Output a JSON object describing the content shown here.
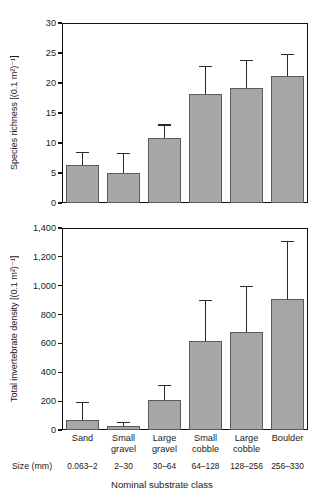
{
  "figure": {
    "background_color": "#ffffff",
    "bar_fill_color": "#a6a6a6",
    "bar_edge_color": "#5c5c5c",
    "axis_color": "#111111"
  },
  "axis": {
    "size_row_caption": "Size (mm)",
    "x_title": "Nominal substrate class"
  },
  "categories": [
    {
      "label_line1": "Sand",
      "label_line2": "",
      "size": "0.063–2"
    },
    {
      "label_line1": "Small",
      "label_line2": "gravel",
      "size": "2–30"
    },
    {
      "label_line1": "Large",
      "label_line2": "gravel",
      "size": "30–64"
    },
    {
      "label_line1": "Small",
      "label_line2": "cobble",
      "size": "64–128"
    },
    {
      "label_line1": "Large",
      "label_line2": "cobble",
      "size": "128–256"
    },
    {
      "label_line1": "Boulder",
      "label_line2": "",
      "size": "256–330"
    }
  ],
  "chart_data": [
    {
      "type": "bar",
      "panel": "top",
      "title": "",
      "ylabel": "Species richness [(0.1 m²)⁻¹]",
      "xlabel": "Nominal substrate class",
      "categories": [
        "Sand",
        "Small gravel",
        "Large gravel",
        "Small cobble",
        "Large cobble",
        "Boulder"
      ],
      "values": [
        6.3,
        5.0,
        10.8,
        18.1,
        19.1,
        21.2
      ],
      "error_upper": [
        8.5,
        8.4,
        13.1,
        22.9,
        23.9,
        24.8
      ],
      "error_type": "upper-only",
      "ylim": [
        0,
        30
      ],
      "yticks": [
        0,
        5,
        10,
        15,
        20,
        25,
        30
      ],
      "ytick_labels": [
        "0",
        "5",
        "10",
        "15",
        "20",
        "25",
        "30"
      ],
      "grid": false,
      "legend": "none"
    },
    {
      "type": "bar",
      "panel": "bottom",
      "title": "",
      "ylabel": "Total invertebrate density [(0.1 m²)⁻¹]",
      "xlabel": "Nominal substrate class",
      "categories": [
        "Sand",
        "Small gravel",
        "Large gravel",
        "Small cobble",
        "Large cobble",
        "Boulder"
      ],
      "values": [
        70,
        30,
        210,
        620,
        680,
        905
      ],
      "error_upper": [
        195,
        55,
        310,
        900,
        1000,
        1310
      ],
      "error_type": "upper-only",
      "ylim": [
        0,
        1400
      ],
      "yticks": [
        0,
        200,
        400,
        600,
        800,
        1000,
        1200,
        1400
      ],
      "ytick_labels": [
        "0",
        "200",
        "400",
        "600",
        "800",
        "1,000",
        "1,200",
        "1,400"
      ],
      "grid": false,
      "legend": "none"
    }
  ]
}
